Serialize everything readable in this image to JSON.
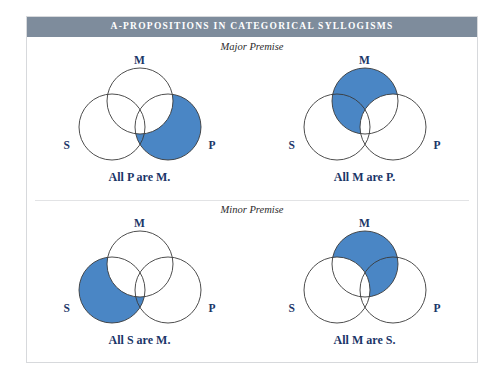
{
  "figure": {
    "title": "A-PROPOSITIONS IN CATEGORICAL SYLLOGISMS",
    "title_bar_color": "#7e8c9c",
    "panel_background": "#ffffff",
    "shade_color": "#4a86c5",
    "outline_color": "#3a3a3a",
    "label_color": "#1b3668",
    "sections": [
      {
        "id": "major",
        "label": "Major Premise",
        "diagrams": [
          {
            "id": "all-p-are-m",
            "caption": "All P are M.",
            "labels": {
              "m": "M",
              "s": "S",
              "p": "P"
            },
            "shaded_region": "P minus M",
            "shaded_circle": "P",
            "subtracted_circle": "M"
          },
          {
            "id": "all-m-are-p",
            "caption": "All M are P.",
            "labels": {
              "m": "M",
              "s": "S",
              "p": "P"
            },
            "shaded_region": "M minus P",
            "shaded_circle": "M",
            "subtracted_circle": "P"
          }
        ]
      },
      {
        "id": "minor",
        "label": "Minor Premise",
        "diagrams": [
          {
            "id": "all-s-are-m",
            "caption": "All S are M.",
            "labels": {
              "m": "M",
              "s": "S",
              "p": "P"
            },
            "shaded_region": "S minus M",
            "shaded_circle": "S",
            "subtracted_circle": "M"
          },
          {
            "id": "all-m-are-s",
            "caption": "All M are S.",
            "labels": {
              "m": "M",
              "s": "S",
              "p": "P"
            },
            "shaded_region": "M minus S",
            "shaded_circle": "M",
            "subtracted_circle": "S"
          }
        ]
      }
    ]
  },
  "venn_geometry": {
    "circles": {
      "M": {
        "cx": 84,
        "cy": 46,
        "r": 33
      },
      "S": {
        "cx": 56,
        "cy": 72,
        "r": 33
      },
      "P": {
        "cx": 112,
        "cy": 72,
        "r": 33
      }
    }
  }
}
